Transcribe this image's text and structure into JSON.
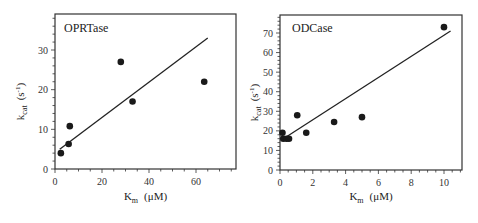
{
  "chart_data": [
    {
      "type": "scatter",
      "title": "OPRTase",
      "xlabel": "K_m (μM)",
      "ylabel": "k_cat (s^-1)",
      "xlim": [
        0,
        77
      ],
      "ylim": [
        0,
        39
      ],
      "x_ticks": [
        0,
        20,
        40,
        60
      ],
      "y_ticks": [
        0,
        10,
        20,
        30
      ],
      "grid": false,
      "legend": null,
      "series": [
        {
          "name": "data",
          "x": [
            2.5,
            5.8,
            6.3,
            28,
            33,
            63.5
          ],
          "y": [
            4,
            6.3,
            10.8,
            27,
            17,
            22
          ]
        }
      ],
      "fit_line": {
        "x": [
          2,
          65
        ],
        "y": [
          5,
          33
        ]
      }
    },
    {
      "type": "scatter",
      "title": "ODCase",
      "xlabel": "K_m (μM)",
      "ylabel": "k_cat (s^-1)",
      "xlim": [
        0,
        11
      ],
      "ylim": [
        0,
        79
      ],
      "x_ticks": [
        0,
        2,
        4,
        6,
        8,
        10
      ],
      "y_ticks": [
        0,
        10,
        20,
        30,
        40,
        50,
        60,
        70
      ],
      "grid": false,
      "legend": null,
      "series": [
        {
          "name": "data",
          "x": [
            0.15,
            0.2,
            0.4,
            0.55,
            1.05,
            1.6,
            3.3,
            5.0,
            10.0
          ],
          "y": [
            19,
            16,
            16,
            16,
            28,
            19,
            24.5,
            27,
            73
          ]
        }
      ],
      "fit_line": {
        "x": [
          0.3,
          10.4
        ],
        "y": [
          16.5,
          71
        ]
      }
    }
  ],
  "panels": {
    "left": {
      "title": "OPRTase",
      "ylabel_main": "k",
      "ylabel_sub": "cat",
      "ylabel_unit": "(s",
      "ylabel_exp": "-1",
      "ylabel_close": ")",
      "xlabel_main": "K",
      "xlabel_sub": "m",
      "xlabel_unit": "(μM)"
    },
    "right": {
      "title": "ODCase",
      "ylabel_main": "k",
      "ylabel_sub": "cat",
      "ylabel_unit": "(s",
      "ylabel_exp": "-1",
      "ylabel_close": ")",
      "xlabel_main": "K",
      "xlabel_sub": "m",
      "xlabel_unit": "(μM)"
    }
  }
}
